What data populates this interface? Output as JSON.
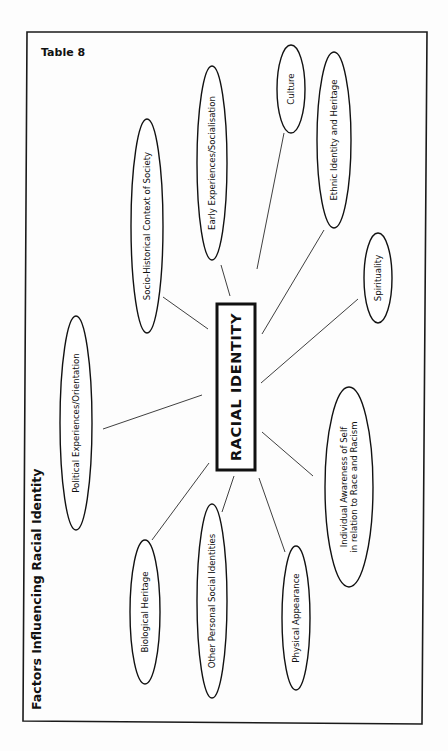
{
  "table_label": "Table 8",
  "heading": "Factors Influencing Racial Identity",
  "center": {
    "label": "RACIAL IDENTITY"
  },
  "factors": [
    {
      "id": "culture",
      "lines": [
        "Culture"
      ]
    },
    {
      "id": "ethnic-identity",
      "lines": [
        "Ethnic Identity and Heritage"
      ]
    },
    {
      "id": "early-experiences",
      "lines": [
        "Early Experiences/Socialisation"
      ]
    },
    {
      "id": "socio-historical",
      "lines": [
        "Socio-Historical Context of Society"
      ]
    },
    {
      "id": "spirituality",
      "lines": [
        "Spirituality"
      ]
    },
    {
      "id": "political",
      "lines": [
        "Political Experiences/Orientation"
      ]
    },
    {
      "id": "individual-awareness",
      "lines": [
        "Individual Awareness of Self",
        "in relation to Race and Racism"
      ]
    },
    {
      "id": "biological-heritage",
      "lines": [
        "Biological Heritage"
      ]
    },
    {
      "id": "other-identities",
      "lines": [
        "Other Personal Social Identities"
      ]
    },
    {
      "id": "physical-appearance",
      "lines": [
        "Physical Appearance"
      ]
    }
  ]
}
